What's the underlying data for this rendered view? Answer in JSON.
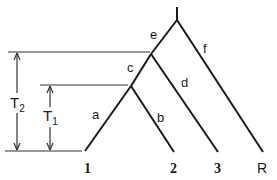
{
  "diagram": {
    "type": "phylogenetic-tree",
    "branch_labels": {
      "a": "a",
      "b": "b",
      "c": "c",
      "d": "d",
      "e": "e",
      "f": "f"
    },
    "leaves": [
      {
        "id": "1",
        "label": "1"
      },
      {
        "id": "2",
        "label": "2"
      },
      {
        "id": "3",
        "label": "3"
      },
      {
        "id": "R",
        "label": "R"
      }
    ],
    "time_markers": {
      "T2": {
        "main": "T",
        "sub": "2"
      },
      "T1": {
        "main": "T",
        "sub": "1"
      }
    },
    "colors": {
      "line": "#1a1a1a",
      "background": "#ffffff"
    }
  }
}
